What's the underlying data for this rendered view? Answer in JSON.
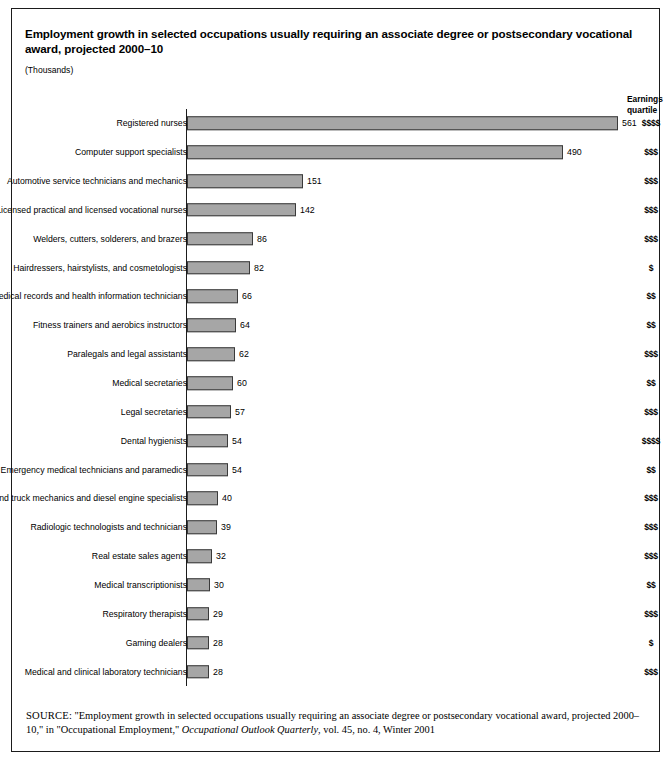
{
  "top_caption": "",
  "figure": {
    "title": "Employment growth in selected occupations usually requiring an associate degree or postsecondary vocational award, projected 2000–10",
    "units": "(Thousands)",
    "quartile_header_line1": "Earnings",
    "quartile_header_line2": "quartile",
    "source_keyword": "SOURCE",
    "source_text_part1": ": \"Employment growth in selected occupations usually requiring an associate degree or postsecondary vocational award, projected 2000–10,\" in \"Occupational Employment,\" ",
    "source_italic": "Occupational Outlook Quarterly",
    "source_text_part2": ", vol. 45, no. 4, Winter 2001"
  },
  "colors": {
    "bar_fill": "#a6a6a6",
    "bar_border": "#3a3a3a",
    "box_border": "#1b1b1b",
    "text": "#000000"
  },
  "chart_data": {
    "type": "bar",
    "orientation": "horizontal",
    "title": "Employment growth in selected occupations usually requiring an associate degree or postsecondary vocational award, projected 2000–10",
    "xlabel": "",
    "ylabel": "",
    "units": "Thousands",
    "xlim": [
      0,
      575
    ],
    "grid": false,
    "legend": null,
    "extra_column_header": "Earnings quartile",
    "categories": [
      "Registered nurses",
      "Computer support specialists",
      "Automotive service technicians and mechanics",
      "Licensed practical and licensed vocational nurses",
      "Welders, cutters, solderers, and brazers",
      "Hairdressers, hairstylists, and cosmetologists",
      "Medical records and health information technicians",
      "Fitness trainers and aerobics instructors",
      "Paralegals and legal assistants",
      "Medical secretaries",
      "Legal secretaries",
      "Dental hygienists",
      "Emergency medical technicians and paramedics",
      "Bus and truck mechanics and diesel engine specialists",
      "Radiologic technologists and technicians",
      "Real estate sales agents",
      "Medical transcriptionists",
      "Respiratory therapists",
      "Gaming dealers",
      "Medical and clinical laboratory technicians"
    ],
    "values": [
      561,
      490,
      151,
      142,
      86,
      82,
      66,
      64,
      62,
      60,
      57,
      54,
      54,
      40,
      39,
      32,
      30,
      29,
      28,
      28
    ],
    "earnings_quartile": [
      "$$$$",
      "$$$",
      "$$$",
      "$$$",
      "$$$",
      "$",
      "$$",
      "$$",
      "$$$",
      "$$",
      "$$$",
      "$$$$",
      "$$",
      "$$$",
      "$$$",
      "$$$",
      "$$",
      "$$$",
      "$",
      "$$$"
    ]
  }
}
